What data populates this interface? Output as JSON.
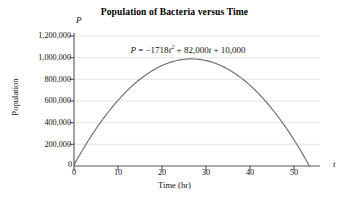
{
  "chart_data": {
    "type": "line",
    "title": "Population of Bacteria versus Time",
    "xlabel": "Time (hr)",
    "ylabel": "Population",
    "x_axis_variable": "t",
    "y_axis_variable": "P",
    "xlim": [
      0,
      50
    ],
    "ylim": [
      0,
      1200000
    ],
    "grid": "horizontal",
    "legend": "none",
    "annotation": {
      "text": "P = −1718t² + 82,000t + 10,000",
      "lhs": "P",
      "equals": "=",
      "quadratic_coefficient": "−1718",
      "quadratic_term": "t",
      "quadratic_power": "2",
      "linear_sign": "+",
      "linear_coefficient": "82,000",
      "linear_term": "t",
      "constant_sign": "+",
      "constant": "10,000"
    },
    "equation_coefficients": {
      "a": -1718,
      "b": 82000,
      "c": 10000
    },
    "xticks": [
      0,
      10,
      20,
      30,
      40,
      50
    ],
    "xtick_labels": [
      "0",
      "10",
      "20",
      "30",
      "40",
      "50"
    ],
    "yticks": [
      0,
      200000,
      400000,
      600000,
      800000,
      1000000,
      1200000
    ],
    "ytick_labels": [
      "0",
      "200,000",
      "400,000",
      "600,000",
      "800,000",
      "1,000,000",
      "1,200,000"
    ],
    "origin_label": "0",
    "series": [
      {
        "name": "P(t)",
        "color": "#6e6e6e",
        "x": [
          0,
          2,
          4,
          6,
          8,
          10,
          12,
          14,
          16,
          18,
          20,
          22,
          24,
          26,
          28,
          30,
          32,
          34,
          36,
          38,
          40,
          42,
          44,
          46,
          47.3
        ],
        "values": [
          10000,
          167128,
          320512,
          470152,
          616048,
          758200,
          896608,
          1031272,
          1162192,
          1289368,
          1412800,
          1532488,
          1648432,
          1760632,
          1869088,
          1973800,
          1902768,
          1827992,
          1749472,
          1667208,
          1581200,
          1491448,
          1397952,
          1300712,
          1240000
        ],
        "values_note": "Curve is P = -1718t^2 + 82000t + 10000; plotted from t=0 to the positive root near t=47.8"
      }
    ],
    "curve_features": {
      "vertex_t": 23.9,
      "vertex_p": 988000,
      "y_intercept": 10000,
      "positive_root": 47.8
    }
  },
  "colors": {
    "curve": "#6e6e6e",
    "axis": "#555555",
    "grid": "#e2e2e2",
    "text": "#111111",
    "background": "#ffffff"
  }
}
